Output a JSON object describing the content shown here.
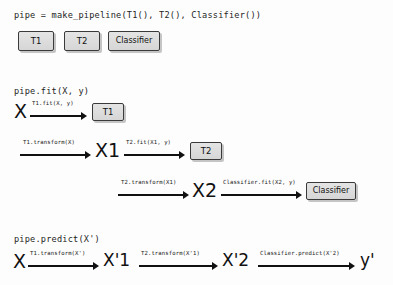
{
  "figure": {
    "background_color": "#fdfdfd",
    "box_fill_color": "#dcdcdc",
    "box_border_color": "#3a3a3a",
    "arrow_color": "#111111"
  },
  "section_pipeline": {
    "heading": "pipe = make_pipeline(T1(), T2(), Classifier())",
    "boxes": [
      {
        "label": "T1"
      },
      {
        "label": "T2"
      },
      {
        "label": "Classifier"
      }
    ]
  },
  "section_fit": {
    "heading": "pipe.fit(X, y)",
    "rows": [
      {
        "input_symbol": "X",
        "arrow_label": "T1.fit(X, y)",
        "target_box": "T1"
      },
      {
        "arrow_label_1": "T1.transform(X)",
        "mid_symbol": "X1",
        "arrow_label_2": "T2.fit(X1, y)",
        "target_box": "T2"
      },
      {
        "arrow_label_1": "T2.transform(X1)",
        "mid_symbol": "X2",
        "arrow_label_2": "Classifier.fit(X2, y)",
        "target_box": "Classifier"
      }
    ]
  },
  "section_predict": {
    "heading": "pipe.predict(X')",
    "input_symbol": "X",
    "steps": [
      {
        "arrow_label": "T1.transform(X')",
        "result_symbol": "X'1"
      },
      {
        "arrow_label": "T2.transform(X'1)",
        "result_symbol": "X'2"
      },
      {
        "arrow_label": "Classifier.predict(X'2)",
        "result_symbol": "y'"
      }
    ]
  }
}
